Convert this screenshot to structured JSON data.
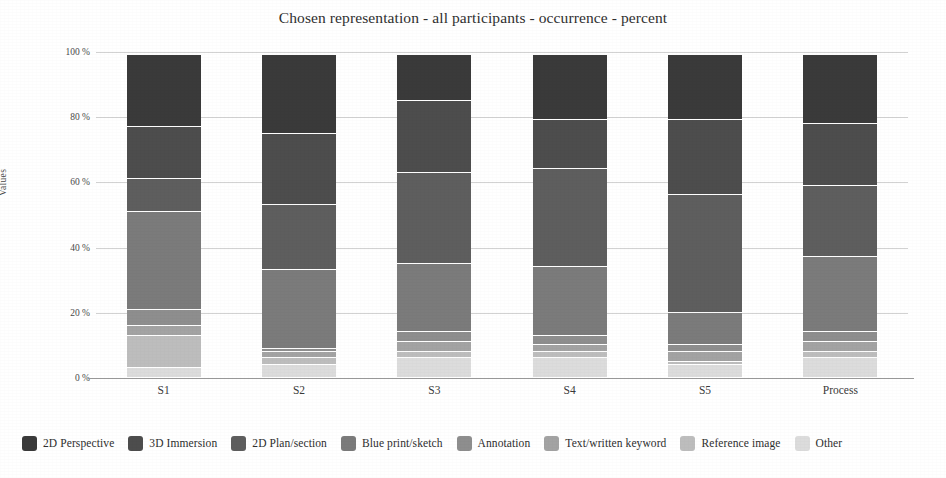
{
  "chart_data": {
    "type": "bar",
    "stacked": true,
    "stack_mode": "percent",
    "title": "Chosen representation - all participants - occurrence - percent",
    "xlabel": "",
    "ylabel": "Values",
    "ylim": [
      0,
      100
    ],
    "ytick_labels": [
      "0 %",
      "20 %",
      "40 %",
      "60 %",
      "80 %",
      "100 %"
    ],
    "ytick_values": [
      0,
      20,
      40,
      60,
      80,
      100
    ],
    "grid": true,
    "legend_position": "bottom",
    "categories": [
      "S1",
      "S2",
      "S3",
      "S4",
      "S5",
      "Process"
    ],
    "series": [
      {
        "name": "2D Perspective",
        "color": "#3a3a3a",
        "values": [
          22.0,
          24.0,
          14.0,
          20.0,
          20.0,
          21.0
        ]
      },
      {
        "name": "3D Immersion",
        "color": "#4d4d4d",
        "values": [
          16.0,
          22.0,
          22.0,
          15.0,
          23.0,
          19.0
        ]
      },
      {
        "name": "2D Plan/section",
        "color": "#5e5e5e",
        "values": [
          10.0,
          20.0,
          28.0,
          30.0,
          36.0,
          22.0
        ]
      },
      {
        "name": "Blue print/sketch",
        "color": "#7b7b7b",
        "values": [
          30.0,
          24.0,
          21.0,
          21.0,
          10.0,
          23.0
        ]
      },
      {
        "name": "Annotation",
        "color": "#8e8e8e",
        "values": [
          5.0,
          1.0,
          3.0,
          3.0,
          2.0,
          3.0
        ]
      },
      {
        "name": "Text/written keyword",
        "color": "#a3a3a3",
        "values": [
          3.0,
          2.0,
          3.0,
          2.0,
          3.0,
          3.0
        ]
      },
      {
        "name": "Reference image",
        "color": "#bdbdbd",
        "values": [
          10.0,
          2.0,
          2.0,
          2.0,
          1.0,
          2.0
        ]
      },
      {
        "name": "Other",
        "color": "#dcdcdc",
        "values": [
          3.0,
          4.0,
          6.0,
          6.0,
          4.0,
          6.0
        ]
      }
    ]
  }
}
